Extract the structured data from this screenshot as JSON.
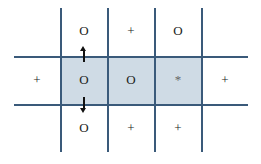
{
  "grid": {
    "rows": [
      [
        "",
        "O",
        "+",
        "O",
        ""
      ],
      [
        "+",
        "O",
        "O",
        "*",
        "+"
      ],
      [
        "",
        "O",
        "+",
        "+",
        ""
      ]
    ],
    "highlighted_row": 1,
    "highlighted_cols": [
      1,
      2,
      3
    ],
    "shade_color": "#cfdbe5",
    "line_color": "#3a5a7a"
  },
  "arrows": [
    {
      "from": "row1-col1",
      "direction": "up"
    },
    {
      "from": "row1-col1",
      "direction": "down"
    }
  ]
}
